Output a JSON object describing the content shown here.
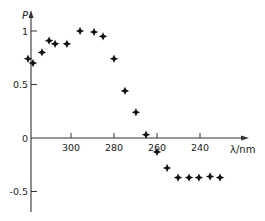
{
  "chart_data": {
    "type": "scatter",
    "title": "",
    "xlabel": "λ/nm",
    "ylabel": "P",
    "x_direction": "decreasing",
    "xlim": [
      320,
      224
    ],
    "ylim": [
      -0.7,
      1.2
    ],
    "x_ticks": [
      300,
      280,
      260,
      240
    ],
    "x_tick_labels": [
      "300",
      "280",
      "260",
      "240"
    ],
    "y_ticks": [
      1,
      0.5,
      0,
      -0.5
    ],
    "y_tick_labels": [
      "1",
      "0.5",
      "0",
      "-0.5"
    ],
    "grid": false,
    "legend": null,
    "marker": "plus-diamond",
    "series": [
      {
        "name": "P",
        "x": [
          320,
          317.7,
          313.5,
          310.2,
          307.4,
          301.9,
          295.8,
          289.3,
          285.1,
          280,
          274.9,
          269.8,
          265.1,
          260,
          255.3,
          250.2,
          245.1,
          240.5,
          235.3,
          230.7
        ],
        "y": [
          0.74,
          0.7,
          0.8,
          0.91,
          0.88,
          0.88,
          1.0,
          0.99,
          0.95,
          0.74,
          0.44,
          0.24,
          0.03,
          -0.13,
          -0.28,
          -0.37,
          -0.37,
          -0.37,
          -0.36,
          -0.37
        ]
      }
    ]
  },
  "axes": {
    "y_label": "P",
    "x_label": "λ/nm"
  }
}
